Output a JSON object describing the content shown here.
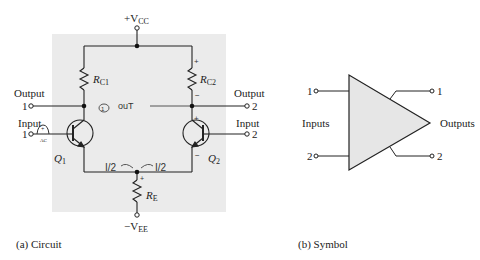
{
  "figure": {
    "circuit": {
      "caption": "(a) Circuit",
      "supply_top": "+V",
      "supply_top_sub": "CC",
      "supply_bottom": "−V",
      "supply_bottom_sub": "EE",
      "rc1": "R",
      "rc1_sub": "C1",
      "rc2": "R",
      "rc2_sub": "C2",
      "re": "R",
      "re_sub": "E",
      "q1": "Q",
      "q1_sub": "1",
      "q2": "Q",
      "q2_sub": "2",
      "output1_label": "Output",
      "output1_num": "1",
      "output2_label": "Output",
      "output2_num": "2",
      "input1_label": "Input",
      "input1_num": "1",
      "input2_label": "Input",
      "input2_num": "2",
      "source_label": "AC",
      "annotations": {
        "out": "ouT",
        "circled": "①",
        "half_left": "I/2",
        "half_right": "I/2",
        "plus_rc2": "+",
        "minus_rc2": "−",
        "plus_q2": "+",
        "minus_q2": "−",
        "plus_re": "+",
        "plus_src": "+"
      },
      "background_color": "#ebebeb"
    },
    "symbol": {
      "caption": "(b) Symbol",
      "inputs_label": "Inputs",
      "outputs_label": "Outputs",
      "in1": "1",
      "in2": "2",
      "out1": "1",
      "out2": "2",
      "fill_color": "#e6e6e6"
    }
  }
}
